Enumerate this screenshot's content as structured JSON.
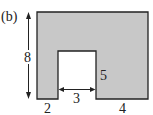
{
  "figure": {
    "label": "(b)",
    "shape": {
      "fill": "#c8c8c8",
      "stroke": "#222222",
      "description": "Rectangle with a rectangular notch cut from the bottom"
    },
    "dimensions": {
      "height": "8",
      "notch_height": "5",
      "notch_width": "3",
      "left_base": "2",
      "right_base": "4"
    }
  }
}
